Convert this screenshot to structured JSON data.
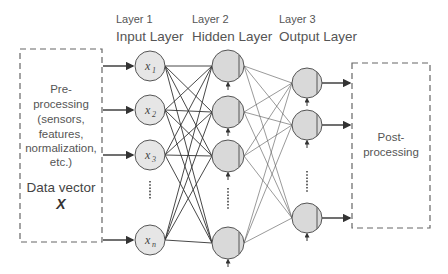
{
  "diagram": {
    "type": "feedforward-neural-network",
    "preprocessing_box": {
      "lines": [
        "Pre-",
        "processing",
        "(sensors,",
        "features,",
        "normalization,",
        "etc.)"
      ],
      "data_vector_label": "Data vector",
      "data_vector_symbol": "X"
    },
    "postprocessing_box": {
      "lines": [
        "Post-",
        "processing"
      ]
    },
    "layers": [
      {
        "index_label": "Layer 1",
        "name": "Input Layer",
        "nodes": [
          {
            "var": "x",
            "sub": "1"
          },
          {
            "var": "x",
            "sub": "2"
          },
          {
            "var": "x",
            "sub": "3"
          },
          {
            "var": "x",
            "sub": "n"
          }
        ]
      },
      {
        "index_label": "Layer 2",
        "name": "Hidden Layer",
        "node_count_shown": 4
      },
      {
        "index_label": "Layer 3",
        "name": "Output Layer",
        "node_count_shown": 3
      }
    ],
    "ellipsis": "⋮",
    "colors": {
      "node_fill": "#d9d9d9",
      "node_stroke": "#555555",
      "line": "#333333",
      "dash_box": "#666666",
      "text": "#555555"
    }
  }
}
